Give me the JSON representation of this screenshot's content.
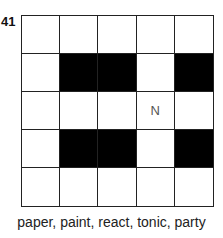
{
  "puzzle": {
    "number": "41",
    "grid": [
      [
        "",
        "",
        "",
        "",
        ""
      ],
      [
        "",
        "#",
        "#",
        "",
        "#"
      ],
      [
        "",
        "",
        "",
        "N",
        ""
      ],
      [
        "",
        "#",
        "#",
        "",
        "#"
      ],
      [
        "",
        "",
        "",
        "",
        ""
      ]
    ],
    "word_list": "paper, paint, react, tonic, party"
  }
}
